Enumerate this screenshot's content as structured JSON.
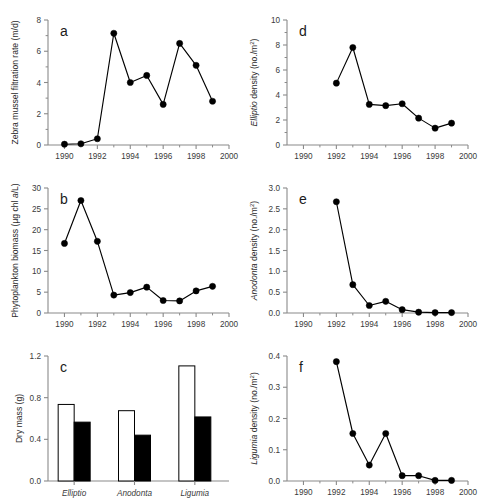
{
  "figure": {
    "panels": [
      "a",
      "b",
      "c",
      "d",
      "e",
      "f"
    ],
    "background": "#ffffff",
    "line_color": "#000000",
    "axis_color": "#8a8a8a"
  },
  "chart_data": [
    {
      "panel": "a",
      "type": "line",
      "title": "",
      "xlabel": "",
      "ylabel": "Zebra mussel filtration rate (m/d)",
      "ylabel_parts": [
        {
          "text": "Zebra mussel filtration rate (m/d)",
          "italic": false
        }
      ],
      "x": [
        1990,
        1991,
        1992,
        1993,
        1994,
        1995,
        1996,
        1997,
        1998,
        1999
      ],
      "values": [
        0.05,
        0.08,
        0.4,
        7.15,
        4.0,
        4.45,
        2.6,
        6.5,
        5.1,
        2.8
      ],
      "xlim": [
        1989,
        2000
      ],
      "ylim": [
        0,
        8
      ],
      "xticks": [
        1990,
        1992,
        1994,
        1996,
        1998,
        2000
      ],
      "xticklabels": [
        "1990",
        "1992",
        "1994",
        "1996",
        "1998",
        "2000"
      ],
      "xminorticks": [
        1991,
        1993,
        1995,
        1997,
        1999
      ],
      "yticks": [
        0,
        2,
        4,
        6,
        8
      ],
      "yticklabels": [
        "0",
        "2",
        "4",
        "6",
        "8"
      ],
      "yminorticks": [
        1,
        3,
        5,
        7
      ],
      "grid": false,
      "legend": "none"
    },
    {
      "panel": "b",
      "type": "line",
      "title": "",
      "xlabel": "",
      "ylabel": "Phytoplankton biomass (µg chl a/L)",
      "ylabel_parts": [
        {
          "text": "Phytoplankton biomass (µg chl ",
          "italic": false
        },
        {
          "text": "a",
          "italic": true
        },
        {
          "text": "/L)",
          "italic": false
        }
      ],
      "x": [
        1990,
        1991,
        1992,
        1993,
        1994,
        1995,
        1996,
        1997,
        1998,
        1999
      ],
      "values": [
        16.7,
        27.0,
        17.2,
        4.3,
        4.9,
        6.2,
        3.0,
        2.9,
        5.3,
        6.4
      ],
      "xlim": [
        1989,
        2000
      ],
      "ylim": [
        0,
        30
      ],
      "xticks": [
        1990,
        1992,
        1994,
        1996,
        1998,
        2000
      ],
      "xticklabels": [
        "1990",
        "1992",
        "1994",
        "1996",
        "1998",
        "2000"
      ],
      "xminorticks": [
        1991,
        1993,
        1995,
        1997,
        1999
      ],
      "yticks": [
        0,
        5,
        10,
        15,
        20,
        25,
        30
      ],
      "yticklabels": [
        "0",
        "5",
        "10",
        "15",
        "20",
        "25",
        "30"
      ],
      "yminorticks": [],
      "grid": false,
      "legend": "none"
    },
    {
      "panel": "c",
      "type": "bar",
      "title": "",
      "xlabel": "",
      "ylabel": "Dry mass (g)",
      "ylabel_parts": [
        {
          "text": "Dry mass (g)",
          "italic": false
        }
      ],
      "categories": [
        "Elliptio",
        "Anodonta",
        "Ligumia"
      ],
      "categories_italic": true,
      "series": [
        {
          "name": "open",
          "fill": "#ffffff",
          "values": [
            0.735,
            0.675,
            1.105
          ]
        },
        {
          "name": "filled",
          "fill": "#000000",
          "values": [
            0.565,
            0.44,
            0.615
          ]
        }
      ],
      "ylim": [
        0,
        1.2
      ],
      "yticks": [
        0.0,
        0.4,
        0.8,
        1.2
      ],
      "yticklabels": [
        "0.0",
        "0.4",
        "0.8",
        "1.2"
      ],
      "grid": false,
      "legend": "none"
    },
    {
      "panel": "d",
      "type": "line",
      "title": "",
      "xlabel": "",
      "ylabel": "Elliptio density (no./m2)",
      "ylabel_parts": [
        {
          "text": "Elliptio",
          "italic": true
        },
        {
          "text": "  density (no./m",
          "italic": false
        },
        {
          "text": "2",
          "italic": false,
          "superscript": true
        },
        {
          "text": ")",
          "italic": false
        }
      ],
      "x": [
        1992,
        1993,
        1994,
        1995,
        1996,
        1997,
        1998,
        1999
      ],
      "values": [
        4.95,
        7.8,
        3.25,
        3.15,
        3.3,
        2.15,
        1.35,
        1.75
      ],
      "xlim": [
        1989,
        2000
      ],
      "ylim": [
        0,
        10
      ],
      "xticks": [
        1990,
        1992,
        1994,
        1996,
        1998,
        2000
      ],
      "xticklabels": [
        "1990",
        "1992",
        "1994",
        "1996",
        "1998",
        "2000"
      ],
      "xminorticks": [
        1991,
        1993,
        1995,
        1997,
        1999
      ],
      "yticks": [
        0,
        2,
        4,
        6,
        8,
        10
      ],
      "yticklabels": [
        "0",
        "2",
        "4",
        "6",
        "8",
        "10"
      ],
      "yminorticks": [
        1,
        3,
        5,
        7,
        9
      ],
      "grid": false,
      "legend": "none"
    },
    {
      "panel": "e",
      "type": "line",
      "title": "",
      "xlabel": "",
      "ylabel": "Anodonta density (no./m2)",
      "ylabel_parts": [
        {
          "text": "Anodonta",
          "italic": true
        },
        {
          "text": "  density (no./m",
          "italic": false
        },
        {
          "text": "2",
          "italic": false,
          "superscript": true
        },
        {
          "text": ")",
          "italic": false
        }
      ],
      "x": [
        1992,
        1993,
        1994,
        1995,
        1996,
        1997,
        1998,
        1999
      ],
      "values": [
        2.67,
        0.68,
        0.18,
        0.28,
        0.08,
        0.02,
        0.01,
        0.01
      ],
      "xlim": [
        1989,
        2000
      ],
      "ylim": [
        0,
        3.0
      ],
      "xticks": [
        1990,
        1992,
        1994,
        1996,
        1998,
        2000
      ],
      "xticklabels": [
        "1990",
        "1992",
        "1994",
        "1996",
        "1998",
        "2000"
      ],
      "xminorticks": [
        1991,
        1993,
        1995,
        1997,
        1999
      ],
      "yticks": [
        0.0,
        0.5,
        1.0,
        1.5,
        2.0,
        2.5,
        3.0
      ],
      "yticklabels": [
        "0.0",
        "0.5",
        "1.0",
        "1.5",
        "2.0",
        "2.5",
        "3.0"
      ],
      "yminorticks": [],
      "grid": false,
      "legend": "none"
    },
    {
      "panel": "f",
      "type": "line",
      "title": "",
      "xlabel": "",
      "ylabel": "Ligumia density (no./m2)",
      "ylabel_parts": [
        {
          "text": "Ligumia",
          "italic": true
        },
        {
          "text": "  density (no./m",
          "italic": false
        },
        {
          "text": "2",
          "italic": false,
          "superscript": true
        },
        {
          "text": ")",
          "italic": false
        }
      ],
      "x": [
        1992,
        1993,
        1994,
        1995,
        1996,
        1997,
        1998,
        1999
      ],
      "values": [
        0.382,
        0.152,
        0.051,
        0.152,
        0.017,
        0.017,
        0.002,
        0.002
      ],
      "xlim": [
        1989,
        2000
      ],
      "ylim": [
        0,
        0.4
      ],
      "xticks": [
        1990,
        1992,
        1994,
        1996,
        1998,
        2000
      ],
      "xticklabels": [
        "1990",
        "1992",
        "1994",
        "1996",
        "1998",
        "2000"
      ],
      "xminorticks": [
        1991,
        1993,
        1995,
        1997,
        1999
      ],
      "yticks": [
        0.0,
        0.1,
        0.2,
        0.3,
        0.4
      ],
      "yticklabels": [
        "0.0",
        "0.1",
        "0.2",
        "0.3",
        "0.4"
      ],
      "yminorticks": [],
      "grid": false,
      "legend": "none"
    }
  ]
}
